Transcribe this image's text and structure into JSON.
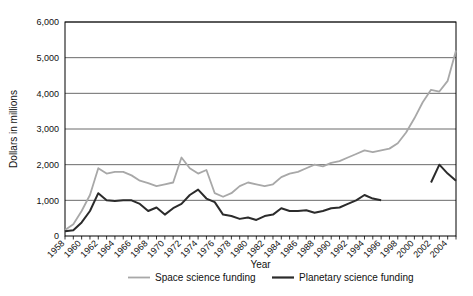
{
  "chart_data": {
    "type": "line",
    "title": "",
    "xlabel": "Year",
    "ylabel": "Dollars in millions",
    "xlim": [
      1958,
      2005
    ],
    "ylim": [
      0,
      6000
    ],
    "grid": true,
    "legend_position": "bottom",
    "y_ticks": [
      0,
      1000,
      2000,
      3000,
      4000,
      5000,
      6000
    ],
    "y_tick_labels": [
      "0",
      "1,000",
      "2,000",
      "3,000",
      "4,000",
      "5,000",
      "6,000"
    ],
    "x_ticks": [
      1958,
      1959,
      1960,
      1961,
      1962,
      1963,
      1964,
      1965,
      1966,
      1967,
      1968,
      1969,
      1970,
      1971,
      1972,
      1973,
      1974,
      1975,
      1976,
      1977,
      1978,
      1979,
      1980,
      1981,
      1982,
      1983,
      1984,
      1985,
      1986,
      1987,
      1988,
      1989,
      1990,
      1991,
      1992,
      1993,
      1994,
      1995,
      1996,
      1997,
      1998,
      1999,
      2000,
      2001,
      2002,
      2003,
      2004,
      2005
    ],
    "x_tick_labels": [
      "1958",
      "1960",
      "1962",
      "1964",
      "1966",
      "1968",
      "1970",
      "1972",
      "1974",
      "1976",
      "1978",
      "1980",
      "1982",
      "1984",
      "1986",
      "1988",
      "1990",
      "1992",
      "1994",
      "1996",
      "1998",
      "2000",
      "2002",
      "2004"
    ],
    "x_tick_label_years": [
      1958,
      1960,
      1962,
      1964,
      1966,
      1968,
      1970,
      1972,
      1974,
      1976,
      1978,
      1980,
      1982,
      1984,
      1986,
      1988,
      1990,
      1992,
      1994,
      1996,
      1998,
      2000,
      2002,
      2004
    ],
    "series": [
      {
        "name": "Space science funding",
        "color": "#a8a8a8",
        "width": 1.8,
        "x": [
          1958,
          1959,
          1960,
          1961,
          1962,
          1963,
          1964,
          1965,
          1966,
          1967,
          1968,
          1969,
          1970,
          1971,
          1972,
          1973,
          1974,
          1975,
          1976,
          1977,
          1978,
          1979,
          1980,
          1981,
          1982,
          1983,
          1984,
          1985,
          1986,
          1987,
          1988,
          1989,
          1990,
          1991,
          1992,
          1993,
          1994,
          1995,
          1996,
          1997,
          1998,
          1999,
          2000,
          2001,
          2002,
          2003,
          2004,
          2005
        ],
        "values": [
          170,
          330,
          700,
          1150,
          1900,
          1750,
          1800,
          1800,
          1700,
          1550,
          1480,
          1400,
          1450,
          1500,
          2200,
          1900,
          1750,
          1850,
          1200,
          1100,
          1200,
          1400,
          1500,
          1450,
          1400,
          1450,
          1650,
          1750,
          1800,
          1900,
          2000,
          1950,
          2050,
          2100,
          2200,
          2300,
          2400,
          2350,
          2400,
          2450,
          2600,
          2900,
          3300,
          3750,
          4100,
          4050,
          4350,
          5200
        ]
      },
      {
        "name": "Planetary science funding",
        "color": "#2b2b2b",
        "width": 2.0,
        "x": [
          1958,
          1959,
          1960,
          1961,
          1962,
          1963,
          1964,
          1965,
          1966,
          1967,
          1968,
          1969,
          1970,
          1971,
          1972,
          1973,
          1974,
          1975,
          1976,
          1977,
          1978,
          1979,
          1980,
          1981,
          1982,
          1983,
          1984,
          1985,
          1986,
          1987,
          1988,
          1989,
          1990,
          1991,
          1992,
          1993,
          1994,
          1995,
          1996
        ],
        "values": [
          130,
          160,
          380,
          700,
          1200,
          1000,
          980,
          1000,
          1000,
          900,
          700,
          800,
          600,
          780,
          900,
          1150,
          1300,
          1050,
          950,
          600,
          560,
          480,
          520,
          450,
          560,
          600,
          780,
          700,
          700,
          720,
          650,
          700,
          780,
          800,
          900,
          1000,
          1150,
          1050,
          1000
        ]
      },
      {
        "name": "Planetary science funding",
        "color": "#2b2b2b",
        "width": 2.0,
        "segment": "continuation",
        "x": [
          2002,
          2003,
          2004,
          2005
        ],
        "values": [
          1500,
          2000,
          1750,
          1550
        ]
      }
    ],
    "legend": [
      {
        "label": "Space science funding",
        "color": "#a8a8a8",
        "width": 1.8
      },
      {
        "label": "Planetary science funding",
        "color": "#2b2b2b",
        "width": 2.2
      }
    ]
  }
}
